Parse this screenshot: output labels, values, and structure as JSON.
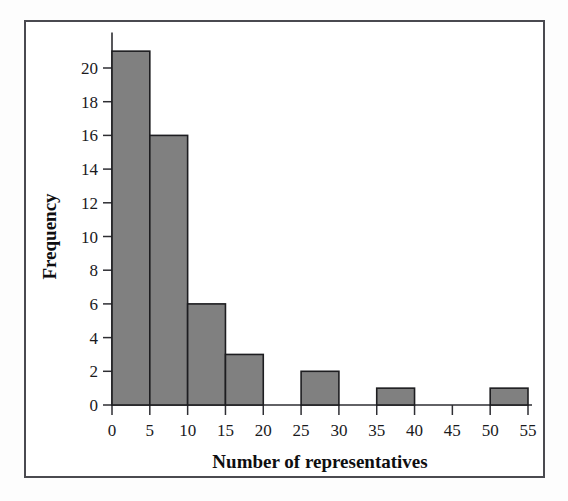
{
  "figure": {
    "background_color": "#ffffff",
    "frame_color": "#4a4a50",
    "bar_fill_color": "#808080",
    "bar_edge_color": "#1d1d20",
    "axis_color": "#2e2e33"
  },
  "chart_data": {
    "type": "bar",
    "title": "",
    "subtitle": "",
    "xlabel": "Number of representatives",
    "ylabel": "Frequency",
    "xlim": [
      0,
      55
    ],
    "ylim": [
      0,
      21
    ],
    "grid": false,
    "legend": null,
    "bin_width": 5,
    "bin_edges": [
      0,
      5,
      10,
      15,
      20,
      25,
      30,
      35,
      40,
      45,
      50,
      55
    ],
    "categories": [
      "0-5",
      "5-10",
      "10-15",
      "15-20",
      "20-25",
      "25-30",
      "30-35",
      "35-40",
      "40-45",
      "45-50",
      "50-55"
    ],
    "values": [
      21,
      16,
      6,
      3,
      0,
      2,
      0,
      1,
      0,
      0,
      1
    ],
    "xticks": [
      0,
      5,
      10,
      15,
      20,
      25,
      30,
      35,
      40,
      45,
      50,
      55
    ],
    "xtick_labels": [
      "0",
      "5",
      "10",
      "15",
      "20",
      "25",
      "30",
      "35",
      "40",
      "45",
      "50",
      "55"
    ],
    "yticks": [
      0,
      2,
      4,
      6,
      8,
      10,
      12,
      14,
      16,
      18,
      20
    ],
    "ytick_labels": [
      "0",
      "2",
      "4",
      "6",
      "8",
      "10",
      "12",
      "14",
      "16",
      "18",
      "20"
    ]
  }
}
